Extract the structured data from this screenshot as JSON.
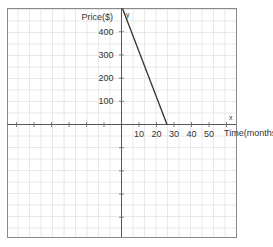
{
  "chart_data": {
    "type": "line",
    "title": "",
    "xlabel": "Time(months)",
    "ylabel": "Price($)",
    "axis_letter_x": "x",
    "axis_letter_y": "y",
    "x_ticks": [
      10,
      20,
      30,
      40,
      50
    ],
    "y_ticks": [
      100,
      200,
      300,
      400
    ],
    "xlim": [
      -65,
      65
    ],
    "ylim": [
      -490,
      500
    ],
    "grid": true,
    "series": [
      {
        "name": "price",
        "x": [
          0,
          26
        ],
        "y": [
          500,
          0
        ],
        "color": "#333333"
      }
    ]
  },
  "colors": {
    "grid": "#e2e2e2",
    "axis": "#555555",
    "frame": "#888888",
    "line": "#333333"
  }
}
